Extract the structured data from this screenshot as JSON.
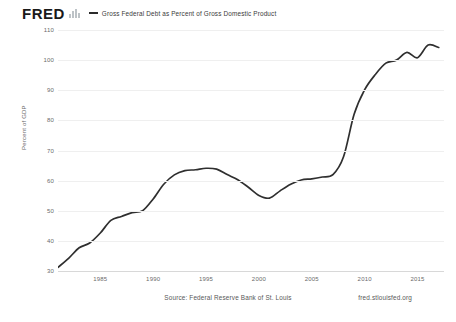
{
  "brand": {
    "logo_text": "FRED",
    "logo_icon": "bar-chart-icon"
  },
  "legend": {
    "marker_icon": "line-swatch-icon",
    "label": "Gross Federal Debt as Percent of Gross Domestic Product",
    "color": "#2f2f2f"
  },
  "footer": {
    "source": "Source: Federal Reserve Bank of St. Louis",
    "url": "fred.stlouisfed.org"
  },
  "chart_data": {
    "type": "line",
    "title": "Gross Federal Debt as Percent of Gross Domestic Product",
    "xlabel": "",
    "ylabel": "Percent of GDP",
    "xlim": [
      1981,
      2017.5
    ],
    "ylim": [
      30,
      110
    ],
    "grid": true,
    "legend_position": "top",
    "ytick_labels": [
      110,
      100,
      90,
      80,
      70,
      60,
      50,
      40,
      30
    ],
    "xtick_labels": [
      1985,
      1990,
      1995,
      2000,
      2005,
      2010,
      2015
    ],
    "series": [
      {
        "name": "Gross Federal Debt as Percent of Gross Domestic Product",
        "color": "#2f2f2f",
        "x": [
          1981,
          1982,
          1983,
          1984,
          1985,
          1986,
          1987,
          1988,
          1989,
          1990,
          1991,
          1992,
          1993,
          1994,
          1995,
          1996,
          1997,
          1998,
          1999,
          2000,
          2001,
          2002,
          2003,
          2004,
          2005,
          2006,
          2007,
          2008,
          2009,
          2010,
          2011,
          2012,
          2013,
          2014,
          2015,
          2016,
          2017
        ],
        "values": [
          31.2,
          34.2,
          37.7,
          39.3,
          42.6,
          46.8,
          48.1,
          49.4,
          50.0,
          53.9,
          58.8,
          61.9,
          63.3,
          63.6,
          64.1,
          63.8,
          62.0,
          60.3,
          57.8,
          55.1,
          54.2,
          56.6,
          58.8,
          60.2,
          60.6,
          61.2,
          62.0,
          67.9,
          82.0,
          90.2,
          95.2,
          99.0,
          100.0,
          102.6,
          100.8,
          105.0,
          104.2
        ]
      }
    ],
    "annotations": []
  }
}
